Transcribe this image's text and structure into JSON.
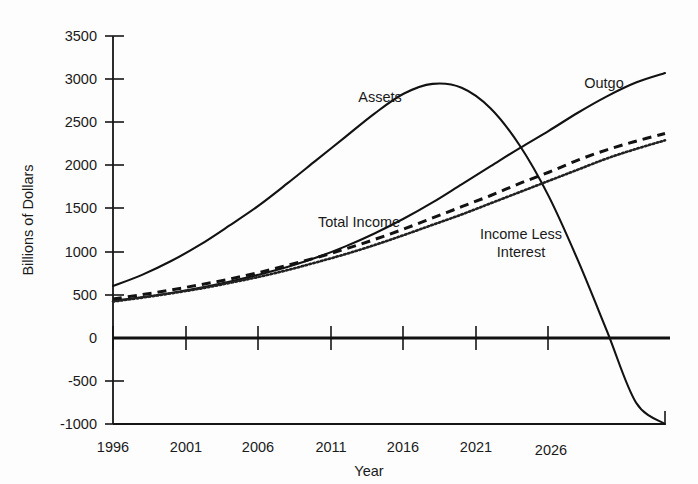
{
  "chart_data": {
    "type": "line",
    "title": "",
    "xlabel": "Year",
    "ylabel": "Billions of Dollars",
    "xlim": [
      1996,
      2034
    ],
    "ylim": [
      -1000,
      3500
    ],
    "grid": false,
    "legend_position": "inline-annotations",
    "xticks": [
      "1996",
      "2001",
      "2006",
      "2011",
      "2016",
      "2021",
      "2026"
    ],
    "xtick_values": [
      1996,
      2001,
      2006,
      2011,
      2016,
      2021,
      2026
    ],
    "yticks": [
      "3500",
      "3000",
      "2500",
      "2000",
      "1500",
      "1000",
      "500",
      "0",
      "-500",
      "-1000"
    ],
    "ytick_values": [
      3500,
      3000,
      2500,
      2000,
      1500,
      1000,
      500,
      0,
      -500,
      -1000
    ],
    "x": [
      1996,
      1998,
      2000,
      2002,
      2004,
      2006,
      2008,
      2010,
      2012,
      2014,
      2016,
      2018,
      2020,
      2022,
      2024,
      2026,
      2028,
      2030,
      2032,
      2034
    ],
    "series": [
      {
        "name": "Assets",
        "style": "solid",
        "label": "Assets",
        "values": [
          600,
          730,
          890,
          1080,
          1300,
          1530,
          1790,
          2060,
          2330,
          2600,
          2830,
          2945,
          2900,
          2660,
          2230,
          1640,
          900,
          80,
          -750,
          -1000
        ]
      },
      {
        "name": "Outgo",
        "style": "solid",
        "label": "Outgo",
        "values": [
          430,
          470,
          520,
          580,
          650,
          730,
          820,
          930,
          1060,
          1210,
          1380,
          1570,
          1780,
          1990,
          2200,
          2400,
          2610,
          2800,
          2960,
          3070
        ]
      },
      {
        "name": "Total Income",
        "style": "dashed",
        "label": "Total Income",
        "values": [
          450,
          500,
          555,
          615,
          680,
          755,
          840,
          930,
          1030,
          1140,
          1260,
          1390,
          1520,
          1650,
          1790,
          1920,
          2060,
          2180,
          2280,
          2370
        ]
      },
      {
        "name": "Income Less Interest",
        "style": "dotted",
        "label": "Income Less Interest",
        "values": [
          420,
          465,
          515,
          570,
          635,
          705,
          785,
          875,
          970,
          1075,
          1190,
          1310,
          1430,
          1560,
          1690,
          1820,
          1950,
          2080,
          2190,
          2290
        ]
      }
    ],
    "annotations": [
      {
        "text": "Assets",
        "x": 380,
        "y": 102
      },
      {
        "text": "Outgo",
        "x": 603,
        "y": 88
      },
      {
        "text": "Total Income",
        "x": 352,
        "y": 225
      },
      {
        "text": "Income Less",
        "x": 520,
        "y": 238
      },
      {
        "text": "Interest",
        "x": 520,
        "y": 255
      }
    ]
  }
}
